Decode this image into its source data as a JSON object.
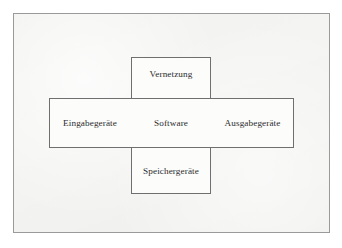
{
  "figure": {
    "type": "cross-diagram",
    "language": "de",
    "frame": {
      "border_color": "#9a9a9a",
      "background_color": "#f4f4f2"
    },
    "box_style": {
      "border_color": "#6f6f6f",
      "fill_color": "#fcfcfb",
      "text_color": "#2b2b2b"
    },
    "cells": {
      "center": "Software",
      "top": "Vernetzung",
      "bottom": "Speichergeräte",
      "left": "Eingabegeräte",
      "right": "Ausgabegeräte"
    }
  }
}
